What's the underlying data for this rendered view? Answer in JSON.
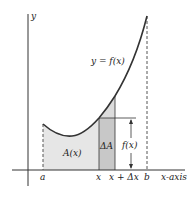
{
  "diagram": {
    "colors": {
      "curve": "#333333",
      "axis": "#333333",
      "area_fill": "#e6e6e6",
      "delta_fill": "#c8c8c8",
      "background": "#ffffff"
    },
    "labels": {
      "y_axis": "y",
      "x_axis": "x-axis",
      "curve": "y = f(x)",
      "area": "A(x)",
      "delta_area": "ΔA",
      "height": "f(x)",
      "tick_a": "a",
      "tick_x": "x",
      "tick_x_dx": "x + Δx",
      "tick_b": "b"
    }
  }
}
